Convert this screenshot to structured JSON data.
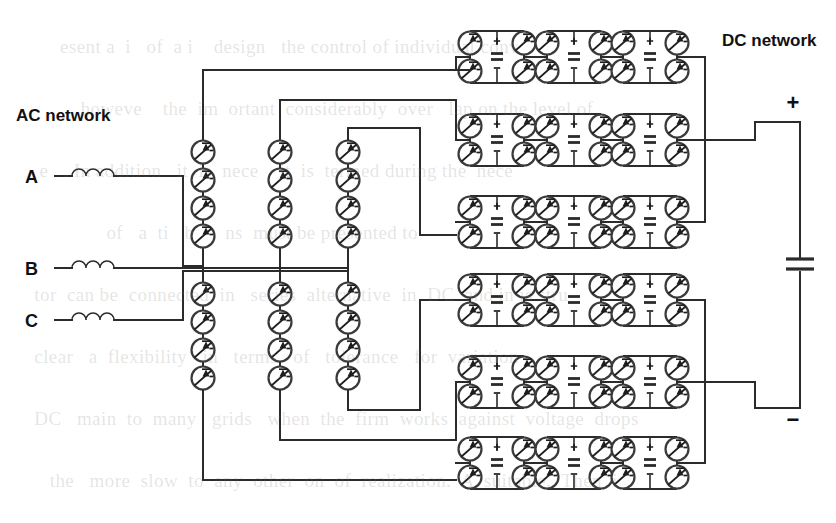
{
  "diagram": {
    "type": "circuit-schematic",
    "background_color": "#ffffff",
    "line_color": "#2b2b2b",
    "text_color": "#111111"
  },
  "labels": {
    "ac_network": "AC network",
    "dc_network": "DC network",
    "phase_a": "A",
    "phase_b": "B",
    "phase_c": "C",
    "dc_positive": "+",
    "dc_negative": "−"
  },
  "ac_side": {
    "phases": [
      {
        "name": "A",
        "y": 176,
        "label": "A"
      },
      {
        "name": "B",
        "y": 268,
        "label": "B"
      },
      {
        "name": "C",
        "y": 320,
        "label": "C"
      }
    ],
    "reactor_symbol": "inductor-coil",
    "reactor_coil_count": 3
  },
  "valve_strings": [
    {
      "id": "leg-a",
      "x": 203,
      "valves_upper": 4,
      "valves_lower": 4,
      "mid_y": 268
    },
    {
      "id": "leg-b",
      "x": 280,
      "valves_upper": 4,
      "valves_lower": 4,
      "mid_y": 268
    },
    {
      "id": "leg-c",
      "x": 348,
      "valves_upper": 4,
      "valves_lower": 4,
      "mid_y": 268
    }
  ],
  "submodule": {
    "type": "full-bridge",
    "valves_per_cell": 4,
    "capacitor_plus": "+",
    "capacitor_minus": "−",
    "valve_symbol": "thyristor-valve"
  },
  "arms": [
    {
      "id": "arm-upper-1",
      "row_y": 57,
      "cells": 3,
      "cell_x": [
        497,
        574,
        650
      ]
    },
    {
      "id": "arm-upper-2",
      "row_y": 140,
      "cells": 3,
      "cell_x": [
        497,
        574,
        650
      ]
    },
    {
      "id": "arm-upper-3",
      "row_y": 222,
      "cells": 3,
      "cell_x": [
        497,
        574,
        650
      ]
    },
    {
      "id": "arm-lower-1",
      "row_y": 300,
      "cells": 3,
      "cell_x": [
        497,
        574,
        650
      ]
    },
    {
      "id": "arm-lower-2",
      "row_y": 382,
      "cells": 3,
      "cell_x": [
        497,
        574,
        650
      ]
    },
    {
      "id": "arm-lower-3",
      "row_y": 463,
      "cells": 3,
      "cell_x": [
        497,
        574,
        650
      ]
    }
  ],
  "dc_bus": {
    "positive_rail_y": 122,
    "negative_rail_y": 408,
    "bus_x": 755,
    "capacitor_y": 265,
    "capacitor_symbol": "dc-link-capacitor"
  },
  "counts": {
    "valve_strings": 3,
    "valves_per_string": 8,
    "submodule_rows": 6,
    "submodules_per_row": 3,
    "total_submodules": 18
  }
}
